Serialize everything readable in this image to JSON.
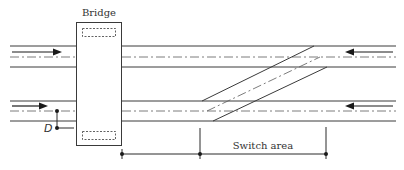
{
  "diagram": {
    "labels": {
      "bridge": "Bridge",
      "switch_area": "Switch area",
      "dimension_marker": "D"
    },
    "tracks": [
      {
        "name": "upper-track",
        "direction": "right-to-left arrow on right, left-to-right arrow on left"
      },
      {
        "name": "lower-track",
        "direction": "right-to-left arrow on right, left-to-right arrow on left"
      }
    ],
    "elements": [
      "bridge",
      "crossover",
      "switch-area-dimension",
      "D-marker"
    ],
    "colors": {
      "line": "#3a3a3a",
      "background": "#ffffff"
    }
  }
}
